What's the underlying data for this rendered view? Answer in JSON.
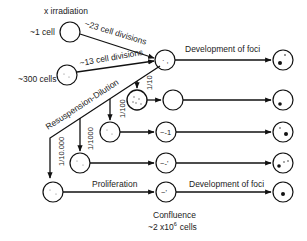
{
  "diagram": {
    "title": "x irradiation",
    "sources": [
      {
        "label": "~1 cell",
        "path_label": "~23 cell divisions"
      },
      {
        "label": "~300 cells",
        "path_label": "~13 cell divisions"
      }
    ],
    "top_path_label": "Development of foci",
    "resuspension_label": "Resuspension-Dilution",
    "dilutions": [
      "1/10",
      "1/100",
      "1/1000",
      "1/10.000"
    ],
    "bottom_left_label": "Proliferation",
    "bottom_right_label": "Development of foci",
    "confluence_label": "Confluence",
    "confluence_cells_prefix": "~2 x10",
    "confluence_cells_exp": "6",
    "confluence_cells_suffix": "cells"
  }
}
